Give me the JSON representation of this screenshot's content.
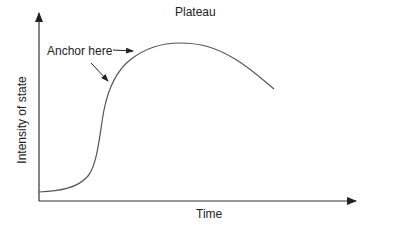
{
  "diagram": {
    "x_axis_label": "Time",
    "y_axis_label": "Intensity of state",
    "annotations": {
      "plateau": "Plateau",
      "anchor": "Anchor here"
    },
    "colors": {
      "axis": "#333333",
      "curve": "#555555",
      "text": "#222222",
      "background": "#ffffff"
    },
    "curve_description": "S-shaped rise from low baseline, peaking at a plateau, then gradually declining"
  }
}
